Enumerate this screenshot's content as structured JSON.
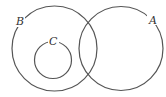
{
  "diagram": {
    "type": "venn",
    "sets": [
      {
        "id": "A",
        "label": "A"
      },
      {
        "id": "B",
        "label": "B"
      },
      {
        "id": "C",
        "label": "C"
      }
    ],
    "relations": [
      {
        "type": "overlap",
        "sets": [
          "A",
          "B"
        ]
      },
      {
        "type": "subset",
        "subset": "C",
        "superset": "B"
      },
      {
        "type": "disjoint",
        "sets": [
          "C",
          "A"
        ]
      }
    ],
    "stroke_color": "#555555"
  }
}
